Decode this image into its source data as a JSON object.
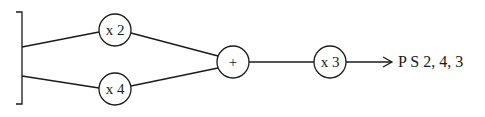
{
  "diagram": {
    "type": "signal-flow",
    "colors": {
      "stroke": "#1a1a1a",
      "background": "#ffffff"
    },
    "input_bracket": {
      "label": ""
    },
    "nodes": [
      {
        "id": "mult2",
        "label": "x 2"
      },
      {
        "id": "mult4",
        "label": "x 4"
      },
      {
        "id": "sum",
        "label": "+"
      },
      {
        "id": "mult3",
        "label": "x 3"
      }
    ],
    "edges": [
      {
        "from": "input",
        "to": "mult2"
      },
      {
        "from": "input",
        "to": "mult4"
      },
      {
        "from": "mult2",
        "to": "sum"
      },
      {
        "from": "mult4",
        "to": "sum"
      },
      {
        "from": "sum",
        "to": "mult3"
      },
      {
        "from": "mult3",
        "to": "output",
        "arrow": true
      }
    ],
    "output": {
      "label": "P S 2, 4, 3"
    }
  }
}
